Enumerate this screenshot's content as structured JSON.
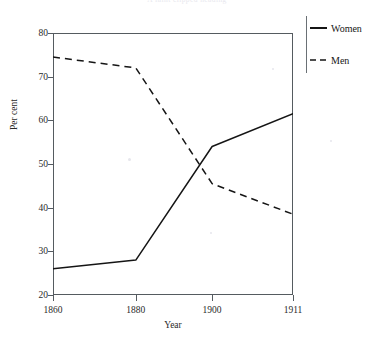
{
  "chart_data": {
    "type": "line",
    "title": "A faint clipped heading",
    "xlabel": "Year",
    "ylabel": "Per cent",
    "x": [
      1860,
      1880,
      1900,
      1911
    ],
    "xticklabels": [
      "1860",
      "1880",
      "1900",
      "1911"
    ],
    "xtick_positions_frac": [
      0.0,
      0.345,
      0.663,
      1.0
    ],
    "ylim": [
      20,
      80
    ],
    "yticks": [
      20,
      30,
      40,
      50,
      60,
      70,
      80
    ],
    "yticklabels": [
      "20",
      "30",
      "40",
      "50",
      "60",
      "70",
      "80"
    ],
    "grid": false,
    "legend_position": "right-outside",
    "series": [
      {
        "name": "Women",
        "style": "solid",
        "color": "#151515",
        "values": [
          26,
          28,
          54,
          61.5
        ]
      },
      {
        "name": "Men",
        "style": "dashed",
        "color": "#151515",
        "values": [
          74.5,
          72,
          45.5,
          38.5
        ]
      }
    ]
  },
  "legend": {
    "entries": [
      {
        "label": "Women",
        "style": "solid"
      },
      {
        "label": "Men",
        "style": "dashed"
      }
    ]
  }
}
